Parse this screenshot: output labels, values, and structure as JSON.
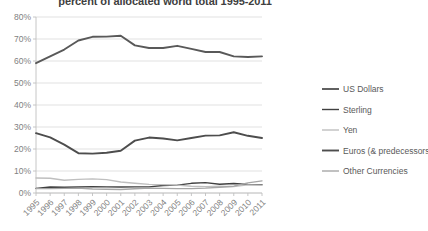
{
  "chart_data": {
    "type": "line",
    "title": "percent of allocated world total 1995-2011",
    "xlabel": "",
    "ylabel": "",
    "ylim": [
      0,
      80
    ],
    "ytick_labels": [
      "0%",
      "10%",
      "20%",
      "30%",
      "40%",
      "50%",
      "60%",
      "70%",
      "80%"
    ],
    "ytick_values": [
      0,
      10,
      20,
      30,
      40,
      50,
      60,
      70,
      80
    ],
    "grid": true,
    "legend_position": "right",
    "categories": [
      "1995",
      "1996",
      "1997",
      "1998",
      "1999",
      "2000",
      "2001",
      "2002",
      "2003",
      "2004",
      "2005",
      "2006",
      "2007",
      "2008",
      "2009",
      "2010",
      "2011"
    ],
    "series": [
      {
        "name": "US Dollars",
        "color": "#595959",
        "width": 1.9,
        "values": [
          59.0,
          62.1,
          65.2,
          69.3,
          71.0,
          71.1,
          71.5,
          67.1,
          65.9,
          65.9,
          66.9,
          65.5,
          64.1,
          64.1,
          62.1,
          61.8,
          62.1
        ]
      },
      {
        "name": "Sterling",
        "color": "#404040",
        "width": 1.4,
        "values": [
          2.1,
          2.7,
          2.6,
          2.7,
          2.9,
          2.8,
          2.7,
          2.8,
          2.8,
          3.4,
          3.6,
          4.4,
          4.7,
          4.0,
          4.3,
          3.9,
          3.8
        ]
      },
      {
        "name": "Yen",
        "color": "#bfbfbf",
        "width": 1.4,
        "values": [
          6.8,
          6.7,
          5.8,
          6.2,
          6.4,
          6.1,
          5.0,
          4.4,
          3.9,
          3.8,
          3.6,
          3.1,
          2.9,
          3.1,
          2.9,
          3.7,
          3.6
        ]
      },
      {
        "name": "Euros (& predecessors)",
        "color": "#4d4d4d",
        "width": 1.9,
        "values": [
          27.2,
          25.3,
          22.0,
          18.1,
          17.9,
          18.3,
          19.2,
          23.8,
          25.2,
          24.8,
          23.9,
          25.0,
          26.1,
          26.2,
          27.6,
          26.0,
          25.0
        ]
      },
      {
        "name": "Other Currencies",
        "color": "#a6a6a6",
        "width": 1.4,
        "values": [
          2.0,
          2.0,
          2.1,
          2.2,
          1.8,
          1.7,
          1.6,
          1.9,
          2.2,
          2.1,
          2.0,
          2.0,
          2.2,
          2.6,
          3.1,
          4.6,
          5.5
        ]
      }
    ]
  },
  "legend": {
    "items": [
      {
        "label": "US Dollars"
      },
      {
        "label": "Sterling"
      },
      {
        "label": "Yen"
      },
      {
        "label": "Euros (& predecessors)"
      },
      {
        "label": "Other Currencies"
      }
    ]
  }
}
